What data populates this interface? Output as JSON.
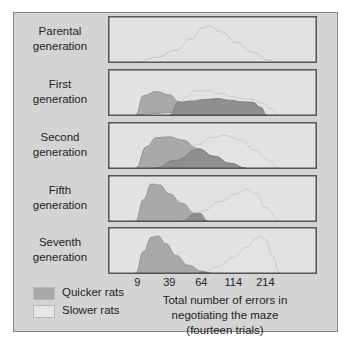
{
  "chart_data": {
    "type": "area",
    "title": "",
    "xlabel": "Total number of errors in negotiating the maze (fourteen trials)",
    "xlabel_lines": [
      "Total number of errors in",
      "negotiating the maze",
      "(fourteen trials)"
    ],
    "x_ticks": [
      "9",
      "39",
      "64",
      "114",
      "214"
    ],
    "x_tick_positions": [
      0,
      1,
      2,
      3,
      4
    ],
    "x_range": [
      -0.6,
      5.3
    ],
    "legend": {
      "placement": "bottom-left",
      "entries": [
        {
          "name": "Quicker rats",
          "color": "#a9a9a9"
        },
        {
          "name": "Slower rats",
          "color": "#e6e6e6"
        }
      ]
    },
    "colors": {
      "quicker_fill": "#a9a9a9",
      "quicker_stroke": "#8c8c8c",
      "slower_fill": "#e3e3e3",
      "slower_stroke": "#c4c4c4",
      "overlap_fill": "#8f8f8f",
      "panel_bg": "#e2e2e2",
      "panel_border": "#555555",
      "frame_bg": "#d4d4d4"
    },
    "panels": [
      {
        "label_lines": [
          "Parental",
          "generation"
        ],
        "series": [
          {
            "name": "Population",
            "kind": "outline",
            "x": [
              0,
              0.6,
              1.2,
              1.7,
              2.05,
              2.25,
              2.6,
              3.1,
              3.6,
              4.1,
              4.3
            ],
            "y": [
              0,
              0.12,
              0.3,
              0.6,
              0.88,
              0.92,
              0.78,
              0.5,
              0.25,
              0.05,
              0
            ]
          }
        ]
      },
      {
        "label_lines": [
          "First",
          "generation"
        ],
        "series": [
          {
            "name": "Slower rats",
            "kind": "slower",
            "x": [
              1.3,
              1.5,
              1.8,
              2.2,
              2.6,
              3.0,
              3.3,
              3.6,
              3.9,
              4.2,
              4.45
            ],
            "y": [
              0,
              0.45,
              0.62,
              0.62,
              0.55,
              0.47,
              0.42,
              0.4,
              0.3,
              0.15,
              0
            ]
          },
          {
            "name": "Quicker rats",
            "kind": "quicker",
            "x": [
              -0.05,
              0.2,
              0.6,
              1.0,
              1.3,
              1.6
            ],
            "y": [
              0,
              0.5,
              0.6,
              0.52,
              0.35,
              0.1
            ]
          },
          {
            "name": "Overlap",
            "kind": "overlap",
            "x": [
              1.0,
              1.3,
              1.7,
              2.1,
              2.5,
              2.9,
              3.3,
              3.6,
              3.85,
              4.05
            ],
            "y": [
              0,
              0.33,
              0.36,
              0.4,
              0.42,
              0.38,
              0.34,
              0.33,
              0.2,
              0
            ]
          }
        ]
      },
      {
        "label_lines": [
          "Second",
          "generation"
        ],
        "series": [
          {
            "name": "Slower rats",
            "kind": "slower",
            "x": [
              0.55,
              1.2,
              1.9,
              2.3,
              2.75,
              3.2,
              3.7,
              4.0,
              4.45
            ],
            "y": [
              0,
              0.3,
              0.6,
              0.78,
              0.83,
              0.72,
              0.45,
              0.25,
              0
            ]
          },
          {
            "name": "Quicker rats",
            "kind": "quicker",
            "x": [
              -0.05,
              0.3,
              0.6,
              1.0,
              1.4,
              1.9,
              2.4,
              2.9,
              3.4
            ],
            "y": [
              0,
              0.55,
              0.78,
              0.8,
              0.72,
              0.5,
              0.3,
              0.12,
              0
            ]
          },
          {
            "name": "Overlap",
            "kind": "overlap",
            "x": [
              0.55,
              1.2,
              1.9,
              2.4,
              2.9,
              3.4
            ],
            "y": [
              0,
              0.2,
              0.48,
              0.3,
              0.12,
              0
            ]
          }
        ]
      },
      {
        "label_lines": [
          "Fifth",
          "generation"
        ],
        "series": [
          {
            "name": "Slower rats",
            "kind": "slower",
            "x": [
              1.4,
              2.0,
              2.6,
              3.1,
              3.4,
              3.7,
              4.0,
              4.45
            ],
            "y": [
              0,
              0.25,
              0.5,
              0.7,
              0.82,
              0.7,
              0.35,
              0
            ]
          },
          {
            "name": "Quicker rats",
            "kind": "quicker",
            "x": [
              -0.05,
              0.2,
              0.45,
              0.7,
              1.0,
              1.4,
              1.8,
              2.2
            ],
            "y": [
              0,
              0.55,
              0.95,
              0.92,
              0.7,
              0.45,
              0.2,
              0
            ]
          },
          {
            "name": "Overlap",
            "kind": "overlap",
            "x": [
              1.4,
              1.8,
              1.95,
              2.2
            ],
            "y": [
              0,
              0.18,
              0.2,
              0
            ]
          }
        ]
      },
      {
        "label_lines": [
          "Seventh",
          "generation"
        ],
        "series": [
          {
            "name": "Slower rats",
            "kind": "slower",
            "x": [
              2.0,
              2.5,
              3.0,
              3.4,
              3.7,
              3.85,
              4.0,
              4.2,
              4.45
            ],
            "y": [
              0,
              0.15,
              0.4,
              0.65,
              0.88,
              0.95,
              0.85,
              0.45,
              0
            ]
          },
          {
            "name": "Quicker rats",
            "kind": "quicker",
            "x": [
              -0.05,
              0.2,
              0.45,
              0.65,
              0.9,
              1.2,
              1.6,
              2.0,
              2.3
            ],
            "y": [
              0,
              0.55,
              0.92,
              0.95,
              0.75,
              0.45,
              0.2,
              0.05,
              0
            ]
          },
          {
            "name": "Overlap",
            "kind": "overlap",
            "x": [
              1.9,
              2.05,
              2.3
            ],
            "y": [
              0,
              0.02,
              0
            ]
          }
        ]
      }
    ]
  }
}
